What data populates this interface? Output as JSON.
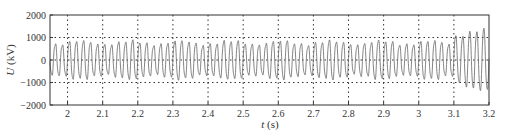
{
  "chart_data": {
    "type": "line",
    "title": "",
    "xlabel": "t (s)",
    "xlabel_var": "t",
    "xlabel_unit": " (s)",
    "ylabel": "U (kV)",
    "ylabel_var": "U",
    "ylabel_unit": " (kV)",
    "xlim": [
      1.95,
      3.2
    ],
    "ylim": [
      -2000,
      2000
    ],
    "xticks": [
      2,
      2.1,
      2.2,
      2.3,
      2.4,
      2.5,
      2.6,
      2.7,
      2.8,
      2.9,
      3,
      3.1,
      3.2
    ],
    "xtick_labels": [
      "2",
      "2.1",
      "2.2",
      "2.3",
      "2.4",
      "2.5",
      "2.6",
      "2.7",
      "2.8",
      "2.9",
      "3",
      "3.1",
      "3.2"
    ],
    "yticks": [
      2000,
      1000,
      0,
      -1000,
      -2000
    ],
    "ytick_labels": [
      "2000",
      "1000",
      "0",
      "−1000",
      "−2000"
    ],
    "grid": "dotted at x ticks and y = ±1000, 0",
    "series": [
      {
        "name": "U",
        "frequency_hz": 50,
        "description": "oscillating voltage waveform, ~±800 kV amplitude with beat-like variation; amplitude grows to ~±1300 kV after t = 3.1 s",
        "segments": [
          {
            "t_start": 1.95,
            "t_end": 3.1,
            "amplitude_kV": 800
          },
          {
            "t_start": 3.1,
            "t_end": 3.2,
            "amplitude_kV": 1250
          }
        ]
      }
    ],
    "color": "#555555"
  }
}
